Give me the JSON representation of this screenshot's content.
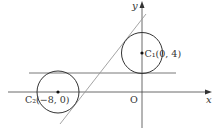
{
  "diagram": {
    "axes": {
      "x_label": "x",
      "y_label": "y",
      "origin_label": "O"
    },
    "circles": [
      {
        "name": "C1",
        "label": "C₁(0, 4)",
        "center": [
          0,
          4
        ]
      },
      {
        "name": "C2",
        "label": "C₂(−8, 0)",
        "center": [
          -8,
          0
        ]
      }
    ],
    "lines": [
      {
        "name": "horizontal-tangent",
        "description": "common horizontal tangent line"
      },
      {
        "name": "slanted-tangent",
        "description": "common slanted tangent line"
      }
    ],
    "colors": {
      "stroke": "#333333",
      "light_stroke": "#999999",
      "background": "#ffffff"
    }
  }
}
